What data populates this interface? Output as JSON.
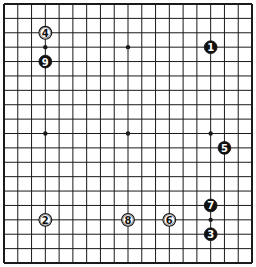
{
  "board": {
    "size": 19,
    "line_color": "#1a1a1a",
    "background": "#ffffff",
    "star_points": [
      [
        3,
        3
      ],
      [
        9,
        3
      ],
      [
        15,
        3
      ],
      [
        3,
        9
      ],
      [
        9,
        9
      ],
      [
        15,
        9
      ],
      [
        3,
        15
      ],
      [
        9,
        15
      ],
      [
        15,
        15
      ]
    ]
  },
  "stones": [
    {
      "number": "1",
      "color": "black",
      "col": 15,
      "row": 3
    },
    {
      "number": "2",
      "color": "white",
      "col": 3,
      "row": 15
    },
    {
      "number": "3",
      "color": "black",
      "col": 15,
      "row": 16
    },
    {
      "number": "4",
      "color": "white",
      "col": 3,
      "row": 2
    },
    {
      "number": "5",
      "color": "black",
      "col": 16,
      "row": 10
    },
    {
      "number": "6",
      "color": "white",
      "col": 12,
      "row": 15
    },
    {
      "number": "7",
      "color": "black",
      "col": 15,
      "row": 14
    },
    {
      "number": "8",
      "color": "white",
      "col": 9,
      "row": 15
    },
    {
      "number": "9",
      "color": "black",
      "col": 3,
      "row": 4
    }
  ]
}
